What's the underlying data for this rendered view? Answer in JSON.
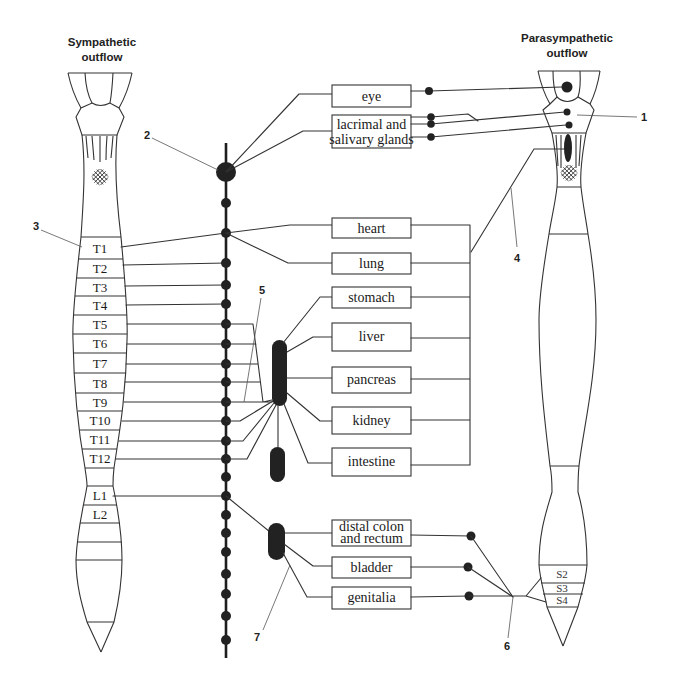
{
  "titles": {
    "sympathetic": {
      "line1": "Sympathetic",
      "line2": "outflow"
    },
    "parasympathetic": {
      "line1": "Parasympathetic",
      "line2": "outflow"
    }
  },
  "organs": [
    {
      "lines": [
        "eye"
      ]
    },
    {
      "lines": [
        "lacrimal and",
        "salivary glands"
      ]
    },
    {
      "lines": [
        "heart"
      ]
    },
    {
      "lines": [
        "lung"
      ]
    },
    {
      "lines": [
        "stomach"
      ]
    },
    {
      "lines": [
        "liver"
      ]
    },
    {
      "lines": [
        "pancreas"
      ]
    },
    {
      "lines": [
        "kidney"
      ]
    },
    {
      "lines": [
        "intestine"
      ]
    },
    {
      "lines": [
        "distal colon",
        "and rectum"
      ]
    },
    {
      "lines": [
        "bladder"
      ]
    },
    {
      "lines": [
        "genitalia"
      ]
    }
  ],
  "spinal_segments": {
    "thoracic": [
      "T1",
      "T2",
      "T3",
      "T4",
      "T5",
      "T6",
      "T7",
      "T8",
      "T9",
      "T10",
      "T11",
      "T12"
    ],
    "lumbar": [
      "L1",
      "L2"
    ],
    "sacral": [
      "S2",
      "S3",
      "S4"
    ]
  },
  "callouts": {
    "c1": "1",
    "c2": "2",
    "c3": "3",
    "c4": "4",
    "c5": "5",
    "c6": "6",
    "c7": "7"
  },
  "colors": {
    "line": "#333333",
    "ganglion": "#222222",
    "text": "#1a1a1a",
    "background": "#ffffff"
  }
}
